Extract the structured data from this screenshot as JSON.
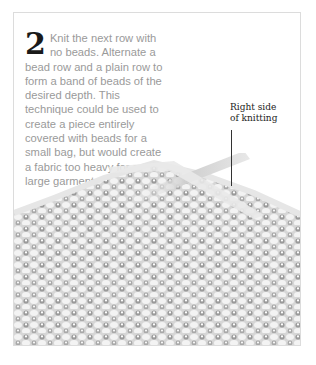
{
  "step": {
    "number": "2",
    "text": "Knit the next row with no beads. Alternate a bead row and a plain row to form a band of beads of the desired depth. This technique could be used to create a piece entirely covered with beads for a small bag, but would create a fabric too heavy for a large garment."
  },
  "callout": {
    "line1": "Right side",
    "line2": "of knitting"
  },
  "image": {
    "subject": "beaded-knitting-on-needles",
    "colors": {
      "light": "#f2f2f2",
      "mid": "#c8c8c8",
      "dark": "#8a8a8a"
    }
  }
}
